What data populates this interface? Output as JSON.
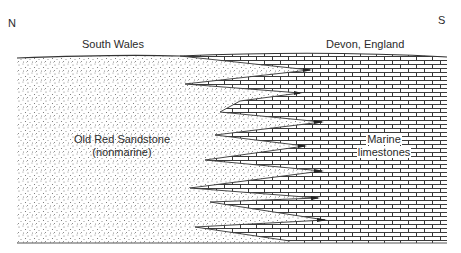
{
  "compass": {
    "north": "N",
    "south": "S"
  },
  "regions": {
    "left_location": "South Wales",
    "right_location": "Devon, England"
  },
  "units": {
    "left": {
      "line1": "Old Red Sandstone",
      "line2": "(nonmarine)",
      "pattern": "stipple"
    },
    "right": {
      "line1": "Marine",
      "line2": "limestones",
      "pattern": "brick"
    }
  },
  "colors": {
    "line": "#333333",
    "stipple": "#555555",
    "brick": "#3a3a3a",
    "background": "#ffffff"
  },
  "interfingering": {
    "sandstone_tongues_tips": [
      [
        310,
        70
      ],
      [
        300,
        93
      ],
      [
        322,
        122
      ],
      [
        305,
        146
      ],
      [
        322,
        171
      ],
      [
        318,
        198
      ],
      [
        325,
        220
      ]
    ],
    "limestone_tongues_tips": [
      [
        185,
        84
      ],
      [
        240,
        101
      ],
      [
        220,
        112
      ],
      [
        215,
        135
      ],
      [
        205,
        160
      ],
      [
        190,
        188
      ],
      [
        210,
        202
      ],
      [
        195,
        227
      ]
    ]
  }
}
